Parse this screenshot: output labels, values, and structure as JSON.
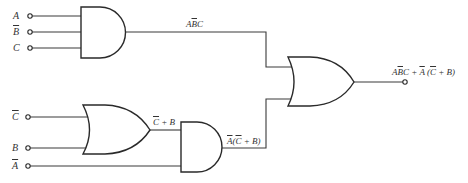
{
  "diagram": {
    "type": "logic-circuit",
    "colors": {
      "line": "#2a2a2a",
      "background": "#ffffff"
    },
    "inputs": [
      {
        "id": "A",
        "label": "A",
        "negated": false
      },
      {
        "id": "Bbar",
        "label": "B",
        "negated": true
      },
      {
        "id": "C",
        "label": "C",
        "negated": false
      },
      {
        "id": "Cbar",
        "label": "C",
        "negated": true
      },
      {
        "id": "B",
        "label": "B",
        "negated": false
      },
      {
        "id": "Abar",
        "label": "A",
        "negated": true
      }
    ],
    "gates": [
      {
        "id": "and1",
        "type": "AND",
        "inputs": [
          "A",
          "Bbar",
          "C"
        ],
        "output_label": "ABC"
      },
      {
        "id": "or1",
        "type": "OR",
        "inputs": [
          "Cbar",
          "B"
        ],
        "output_label": "C + B"
      },
      {
        "id": "and2",
        "type": "AND",
        "inputs": [
          "or1",
          "Abar"
        ],
        "output_label": "A(C + B)"
      },
      {
        "id": "or2",
        "type": "OR",
        "inputs": [
          "and1",
          "and2"
        ],
        "output_label": "ABC + A(C + B)"
      }
    ],
    "labels": {
      "and1_out": {
        "p1": "A",
        "p2": "B",
        "p3": "C"
      },
      "or1_out": {
        "p1": "C",
        "p2": " + B"
      },
      "and2_out": {
        "p1": "A",
        "p2": "(",
        "p3": "C",
        "p4": " + B)"
      },
      "final": {
        "p1": "A",
        "p2": "B",
        "p3": "C",
        "p4": " + ",
        "p5": "A",
        "p6": " (",
        "p7": "C",
        "p8": " + B)"
      }
    }
  }
}
